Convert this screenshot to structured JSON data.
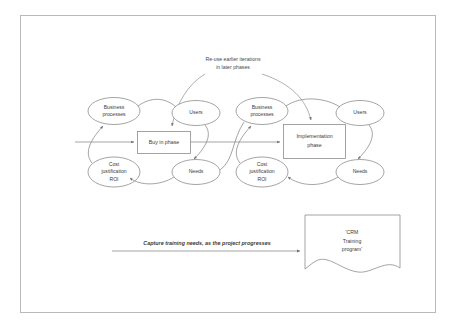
{
  "diagram": {
    "title_note": {
      "line1": "Re-use earlier iterations",
      "line2": "in later phases"
    },
    "phase1": {
      "center_label": "Buy in phase",
      "nodes": {
        "business_processes": {
          "line1": "Business",
          "line2": "processes"
        },
        "users": {
          "line1": "Users"
        },
        "cost_justification": {
          "line1": "Cost",
          "line2": "justification",
          "line3": "ROI"
        },
        "needs": {
          "line1": "Needs"
        }
      }
    },
    "phase2": {
      "center_label_line1": "Implementation",
      "center_label_line2": "phase",
      "nodes": {
        "business_processes": {
          "line1": "Business",
          "line2": "processes"
        },
        "users": {
          "line1": "Users"
        },
        "cost_justification": {
          "line1": "Cost",
          "line2": "justification",
          "line3": "ROI"
        },
        "needs": {
          "line1": "Needs"
        }
      }
    },
    "bottom": {
      "arrow_label": "Capture training needs, as the project progresses",
      "document": {
        "line1": "'CRM",
        "line2": "Training",
        "line3": "program'"
      }
    },
    "colors": {
      "frame_stroke": "#b9b9b9",
      "shape_stroke": "#8d8d8d",
      "text": "#3a3a3a",
      "background": "#ffffff"
    }
  }
}
